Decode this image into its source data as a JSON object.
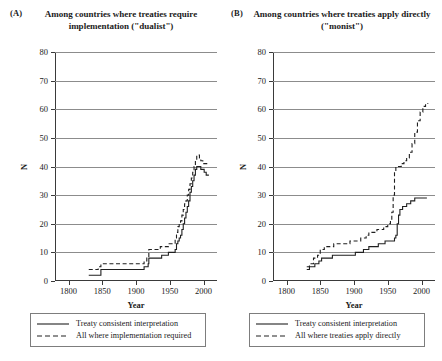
{
  "figure": {
    "panels": [
      {
        "tag": "(A)",
        "title": "Among countries where treaties require implementation (\"dualist\")",
        "legend": [
          {
            "label": "Treaty consistent interpretation",
            "style": "solid"
          },
          {
            "label": "All where implementation required",
            "style": "dashed"
          }
        ]
      },
      {
        "tag": "(B)",
        "title": "Among countries where treaties apply directly (\"monist\")",
        "legend": [
          {
            "label": "Treaty consistent interpretation",
            "style": "solid"
          },
          {
            "label": "All where treaties apply directly",
            "style": "dashed"
          }
        ]
      }
    ]
  },
  "chart_data": [
    {
      "type": "line",
      "panel": "(A)",
      "title": "Among countries where treaties require implementation (\"dualist\")",
      "xlabel": "Year",
      "ylabel": "N",
      "xlim": [
        1780,
        2020
      ],
      "ylim": [
        0,
        80
      ],
      "xticks": [
        1800,
        1850,
        1900,
        1950,
        2000
      ],
      "yticks": [
        0,
        10,
        20,
        30,
        40,
        50,
        60,
        70,
        80
      ],
      "grid": true,
      "legend_position": "below",
      "series": [
        {
          "name": "Treaty consistent interpretation",
          "style": "solid",
          "points": [
            [
              1830,
              2
            ],
            [
              1848,
              2
            ],
            [
              1848,
              4
            ],
            [
              1910,
              4
            ],
            [
              1912,
              5
            ],
            [
              1918,
              6
            ],
            [
              1919,
              8
            ],
            [
              1930,
              8
            ],
            [
              1938,
              9
            ],
            [
              1946,
              9
            ],
            [
              1948,
              10
            ],
            [
              1955,
              10
            ],
            [
              1958,
              11
            ],
            [
              1960,
              13
            ],
            [
              1962,
              14
            ],
            [
              1964,
              15
            ],
            [
              1966,
              16
            ],
            [
              1968,
              18
            ],
            [
              1970,
              20
            ],
            [
              1972,
              22
            ],
            [
              1974,
              24
            ],
            [
              1976,
              26
            ],
            [
              1978,
              28
            ],
            [
              1980,
              31
            ],
            [
              1982,
              33
            ],
            [
              1984,
              35
            ],
            [
              1986,
              37
            ],
            [
              1988,
              39
            ],
            [
              1990,
              40
            ],
            [
              1994,
              40
            ],
            [
              1996,
              39
            ],
            [
              1999,
              39
            ],
            [
              2001,
              38
            ],
            [
              2004,
              37
            ],
            [
              2008,
              37
            ]
          ]
        },
        {
          "name": "All where implementation required",
          "style": "dashed",
          "points": [
            [
              1830,
              4
            ],
            [
              1844,
              4
            ],
            [
              1844,
              5
            ],
            [
              1848,
              6
            ],
            [
              1910,
              6
            ],
            [
              1912,
              7
            ],
            [
              1916,
              8
            ],
            [
              1919,
              11
            ],
            [
              1930,
              11
            ],
            [
              1936,
              12
            ],
            [
              1946,
              12
            ],
            [
              1948,
              13
            ],
            [
              1955,
              13
            ],
            [
              1958,
              15
            ],
            [
              1960,
              17
            ],
            [
              1962,
              19
            ],
            [
              1964,
              20
            ],
            [
              1966,
              21
            ],
            [
              1968,
              23
            ],
            [
              1970,
              25
            ],
            [
              1972,
              27
            ],
            [
              1974,
              28
            ],
            [
              1976,
              30
            ],
            [
              1978,
              32
            ],
            [
              1980,
              34
            ],
            [
              1982,
              36
            ],
            [
              1984,
              38
            ],
            [
              1986,
              40
            ],
            [
              1988,
              42
            ],
            [
              1990,
              44
            ],
            [
              1992,
              44
            ],
            [
              1994,
              43
            ],
            [
              1996,
              42
            ],
            [
              1999,
              41
            ],
            [
              2002,
              41
            ],
            [
              2005,
              41
            ],
            [
              2008,
              41
            ]
          ]
        }
      ]
    },
    {
      "type": "line",
      "panel": "(B)",
      "title": "Among countries where treaties apply directly (\"monist\")",
      "xlabel": "Year",
      "ylabel": "N",
      "xlim": [
        1780,
        2020
      ],
      "ylim": [
        0,
        80
      ],
      "xticks": [
        1800,
        1850,
        1900,
        1950,
        2000
      ],
      "yticks": [
        0,
        10,
        20,
        30,
        40,
        50,
        60,
        70,
        80
      ],
      "grid": true,
      "legend_position": "below",
      "series": [
        {
          "name": "Treaty consistent interpretation",
          "style": "solid",
          "points": [
            [
              1830,
              4
            ],
            [
              1834,
              4
            ],
            [
              1834,
              5
            ],
            [
              1840,
              5
            ],
            [
              1842,
              6
            ],
            [
              1846,
              6
            ],
            [
              1848,
              7
            ],
            [
              1852,
              8
            ],
            [
              1866,
              8
            ],
            [
              1868,
              9
            ],
            [
              1900,
              9
            ],
            [
              1902,
              10
            ],
            [
              1912,
              10
            ],
            [
              1914,
              11
            ],
            [
              1920,
              11
            ],
            [
              1922,
              12
            ],
            [
              1934,
              12
            ],
            [
              1936,
              13
            ],
            [
              1944,
              13
            ],
            [
              1946,
              14
            ],
            [
              1958,
              14
            ],
            [
              1960,
              15
            ],
            [
              1962,
              16
            ],
            [
              1964,
              20
            ],
            [
              1966,
              23
            ],
            [
              1968,
              25
            ],
            [
              1972,
              26
            ],
            [
              1978,
              27
            ],
            [
              1984,
              28
            ],
            [
              1990,
              29
            ],
            [
              1998,
              29
            ],
            [
              2008,
              29
            ]
          ]
        },
        {
          "name": "All where treaties apply directly",
          "style": "dashed",
          "points": [
            [
              1830,
              5
            ],
            [
              1834,
              6
            ],
            [
              1838,
              6
            ],
            [
              1840,
              8
            ],
            [
              1846,
              9
            ],
            [
              1850,
              11
            ],
            [
              1856,
              12
            ],
            [
              1866,
              12
            ],
            [
              1870,
              13
            ],
            [
              1890,
              13
            ],
            [
              1894,
              14
            ],
            [
              1906,
              14
            ],
            [
              1910,
              15
            ],
            [
              1918,
              16
            ],
            [
              1922,
              17
            ],
            [
              1930,
              17
            ],
            [
              1934,
              18
            ],
            [
              1940,
              18
            ],
            [
              1944,
              19
            ],
            [
              1950,
              20
            ],
            [
              1954,
              21
            ],
            [
              1956,
              24
            ],
            [
              1958,
              30
            ],
            [
              1960,
              38
            ],
            [
              1962,
              40
            ],
            [
              1966,
              40
            ],
            [
              1970,
              41
            ],
            [
              1974,
              42
            ],
            [
              1978,
              43
            ],
            [
              1982,
              45
            ],
            [
              1986,
              48
            ],
            [
              1990,
              52
            ],
            [
              1994,
              56
            ],
            [
              1998,
              59
            ],
            [
              2002,
              61
            ],
            [
              2006,
              62
            ],
            [
              2010,
              62
            ]
          ]
        }
      ]
    }
  ]
}
